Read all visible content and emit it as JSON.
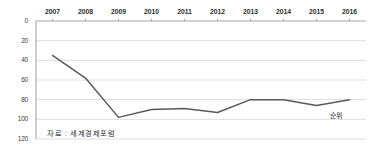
{
  "chart_data": {
    "type": "line",
    "title": "",
    "subtitle": "",
    "xlabel": "",
    "ylabel": "",
    "unit_label": "순위",
    "source_note": "자료 : 세계경제포럼",
    "categories": [
      "2007",
      "2008",
      "2009",
      "2010",
      "2011",
      "2012",
      "2013",
      "2014",
      "2015",
      "2016"
    ],
    "series": [
      {
        "name": "순위",
        "values": [
          35,
          58,
          98,
          90,
          89,
          93,
          80,
          80,
          86,
          80
        ],
        "color": "#595959"
      }
    ],
    "yticks": [
      0,
      20,
      40,
      60,
      80,
      100,
      120
    ],
    "ytick_labels": [
      "0",
      "20",
      "40",
      "60",
      "80",
      "100",
      "120"
    ],
    "ylim": [
      0,
      120
    ],
    "y_inverted": true,
    "grid": true,
    "grid_color": "#d9d9d9",
    "axis_color": "#a6a6a6",
    "legend": "none",
    "x_axis_position": "top"
  }
}
